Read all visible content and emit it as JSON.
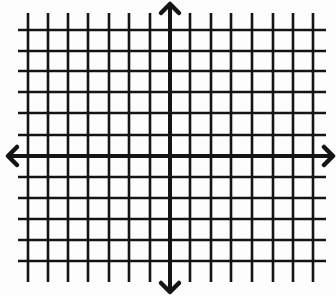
{
  "diagram": {
    "type": "coordinate-grid",
    "top_text_cropped": "",
    "colors": {
      "background": "#fdfdfd",
      "ink": "#141414"
    },
    "grid": {
      "vertical_lines_x": [
        28,
        48,
        68,
        88,
        109,
        129,
        150,
        190,
        211,
        231,
        252,
        273,
        293,
        313
      ],
      "horizontal_lines_y": [
        30,
        51,
        71,
        92,
        113,
        135,
        177,
        198,
        219,
        240,
        261
      ],
      "vertical_extent": [
        13,
        282
      ],
      "horizontal_extent": [
        18,
        326
      ]
    },
    "axes": {
      "x_axis": {
        "y": 156,
        "x_from": 8,
        "x_to": 333,
        "arrows": [
          "left",
          "right"
        ]
      },
      "y_axis": {
        "x": 170,
        "y_from": 4,
        "y_to": 292,
        "arrows": [
          "up",
          "down"
        ]
      }
    },
    "labels": []
  }
}
